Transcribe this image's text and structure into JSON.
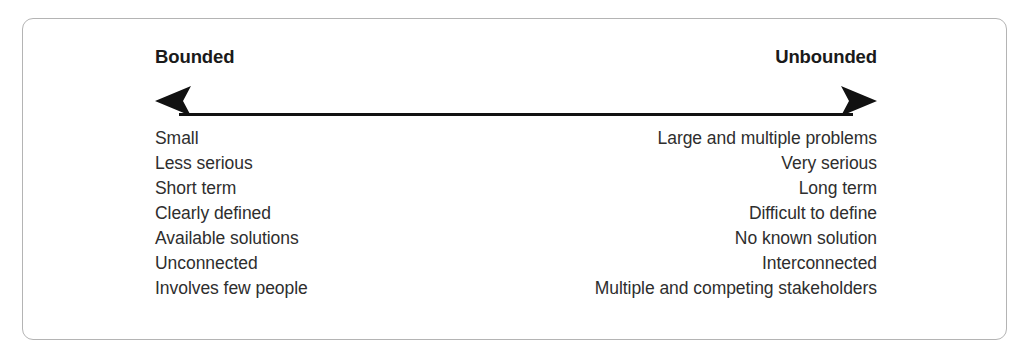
{
  "figure": {
    "frame": {
      "border_color": "#b4b4b4",
      "background_color": "#ffffff",
      "corner_radius": "11px"
    },
    "axis": {
      "left_pole_label": "Bounded",
      "right_pole_label": "Unbounded",
      "arrow_style": "double-headed",
      "arrow_color": "#111111"
    },
    "text_color": "#2e2e2e",
    "heading_color": "#1a1a1a"
  },
  "comparison": {
    "left_column_heading": "Bounded",
    "right_column_heading": "Unbounded",
    "rows": [
      {
        "bounded": "Small",
        "unbounded": "Large and multiple problems"
      },
      {
        "bounded": "Less serious",
        "unbounded": "Very serious"
      },
      {
        "bounded": "Short term",
        "unbounded": "Long term"
      },
      {
        "bounded": "Clearly defined",
        "unbounded": "Difficult to define"
      },
      {
        "bounded": "Available solutions",
        "unbounded": "No known solution"
      },
      {
        "bounded": "Unconnected",
        "unbounded": "Interconnected"
      },
      {
        "bounded": "Involves few people",
        "unbounded": "Multiple and competing stakeholders"
      }
    ]
  }
}
